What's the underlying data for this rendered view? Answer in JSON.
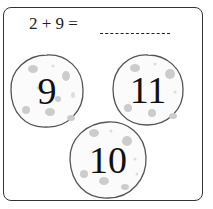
{
  "question": {
    "equation": "2 + 9 =",
    "blank": "_________"
  },
  "options": [
    {
      "label": "9",
      "x": 8,
      "y": 52,
      "size": 78
    },
    {
      "label": "11",
      "x": 110,
      "y": 52,
      "size": 76
    },
    {
      "label": "10",
      "x": 67,
      "y": 119,
      "size": 82
    }
  ],
  "colors": {
    "outline": "#555555",
    "spots": "#c8c8c8",
    "text": "#111111"
  }
}
